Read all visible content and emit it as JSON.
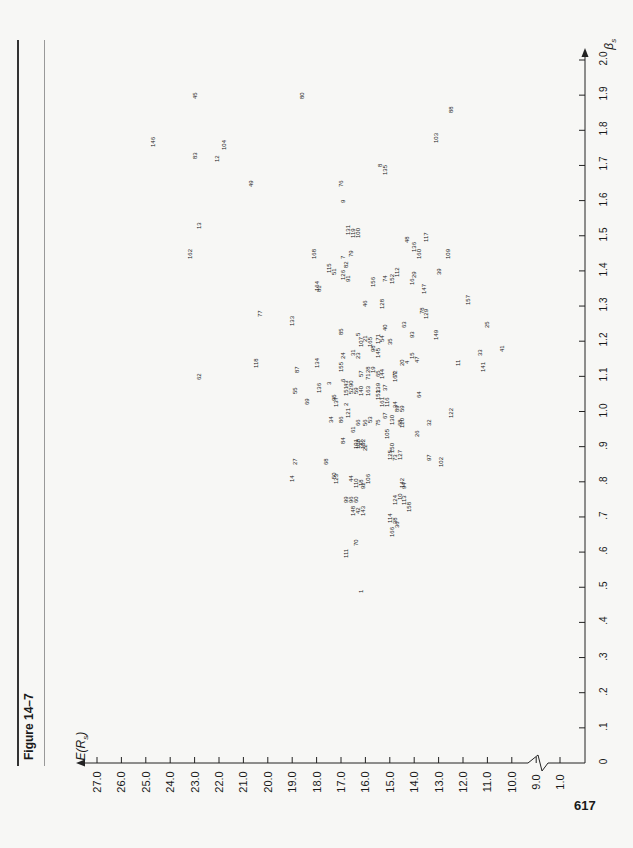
{
  "figure_label": "Figure 14–7",
  "page_number": "617",
  "chart_data": {
    "type": "scatter",
    "title": "Figure 14–7",
    "xlabel": "βs",
    "ylabel": "E(Rs)",
    "xlim": [
      0,
      2.0
    ],
    "ylim": [
      1.0,
      27.0
    ],
    "y_axis_break": "between 1.0 and 9.0",
    "x_ticks": [
      "0",
      ".1",
      ".2",
      ".3",
      ".4",
      ".5",
      ".6",
      ".7",
      ".8",
      ".9",
      "1.0",
      "1.1",
      "1.2",
      "1.3",
      "1.4",
      "1.5",
      "1.6",
      "1.7",
      "1.8",
      "1.9",
      "2.0"
    ],
    "y_ticks": [
      "27.0",
      "26.0",
      "25.0",
      "24.0",
      "23.0",
      "22.0",
      "21.0",
      "20.0",
      "19.0",
      "18.0",
      "17.0",
      "16.0",
      "15.0",
      "14.0",
      "13.0",
      "12.0",
      "11.0",
      "10.0",
      "9.0",
      "1.0"
    ],
    "grid": false,
    "orientation": "rotated 90° counter-clockwise on page",
    "points": [
      {
        "label": "146",
        "beta": 1.77,
        "er": 24.7
      },
      {
        "label": "45",
        "beta": 1.9,
        "er": 23.0
      },
      {
        "label": "83",
        "beta": 1.73,
        "er": 23.0
      },
      {
        "label": "104",
        "beta": 1.76,
        "er": 21.8
      },
      {
        "label": "12",
        "beta": 1.72,
        "er": 22.1
      },
      {
        "label": "80",
        "beta": 1.9,
        "er": 18.6
      },
      {
        "label": "49",
        "beta": 1.65,
        "er": 20.7
      },
      {
        "label": "13",
        "beta": 1.53,
        "er": 22.8
      },
      {
        "label": "162",
        "beta": 1.45,
        "er": 23.2
      },
      {
        "label": "168",
        "beta": 1.45,
        "er": 18.1
      },
      {
        "label": "76",
        "beta": 1.65,
        "er": 17.0
      },
      {
        "label": "9",
        "beta": 1.6,
        "er": 16.9
      },
      {
        "label": "8",
        "beta": 1.7,
        "er": 15.4
      },
      {
        "label": "135",
        "beta": 1.69,
        "er": 15.2
      },
      {
        "label": "88",
        "beta": 1.86,
        "er": 12.5
      },
      {
        "label": "103",
        "beta": 1.78,
        "er": 13.1
      },
      {
        "label": "131",
        "beta": 1.52,
        "er": 16.7
      },
      {
        "label": "119",
        "beta": 1.51,
        "er": 16.5
      },
      {
        "label": "100",
        "beta": 1.51,
        "er": 16.3
      },
      {
        "label": "48",
        "beta": 1.49,
        "er": 14.3
      },
      {
        "label": "136",
        "beta": 1.47,
        "er": 14.0
      },
      {
        "label": "160",
        "beta": 1.45,
        "er": 13.8
      },
      {
        "label": "117",
        "beta": 1.5,
        "er": 13.5
      },
      {
        "label": "109",
        "beta": 1.45,
        "er": 12.6
      },
      {
        "label": "7",
        "beta": 1.44,
        "er": 16.9
      },
      {
        "label": "79",
        "beta": 1.45,
        "er": 16.6
      },
      {
        "label": "115",
        "beta": 1.41,
        "er": 17.5
      },
      {
        "label": "51",
        "beta": 1.4,
        "er": 17.3
      },
      {
        "label": "82",
        "beta": 1.42,
        "er": 16.8
      },
      {
        "label": "126",
        "beta": 1.39,
        "er": 16.9
      },
      {
        "label": "91",
        "beta": 1.38,
        "er": 16.7
      },
      {
        "label": "112",
        "beta": 1.4,
        "er": 14.7
      },
      {
        "label": "164",
        "beta": 1.36,
        "er": 18.0
      },
      {
        "label": "81",
        "beta": 1.35,
        "er": 17.9
      },
      {
        "label": "156",
        "beta": 1.37,
        "er": 15.7
      },
      {
        "label": "74",
        "beta": 1.38,
        "er": 15.2
      },
      {
        "label": "152",
        "beta": 1.38,
        "er": 14.9
      },
      {
        "label": "16",
        "beta": 1.37,
        "er": 14.1
      },
      {
        "label": "29",
        "beta": 1.39,
        "er": 14.0
      },
      {
        "label": "39",
        "beta": 1.4,
        "er": 13.0
      },
      {
        "label": "147",
        "beta": 1.35,
        "er": 13.6
      },
      {
        "label": "157",
        "beta": 1.32,
        "er": 11.8
      },
      {
        "label": "46",
        "beta": 1.31,
        "er": 16.0
      },
      {
        "label": "128",
        "beta": 1.31,
        "er": 15.3
      },
      {
        "label": "78",
        "beta": 1.29,
        "er": 13.7
      },
      {
        "label": "129",
        "beta": 1.28,
        "er": 13.5
      },
      {
        "label": "77",
        "beta": 1.28,
        "er": 20.3
      },
      {
        "label": "133",
        "beta": 1.26,
        "er": 19.0
      },
      {
        "label": "85",
        "beta": 1.23,
        "er": 17.0
      },
      {
        "label": "40",
        "beta": 1.24,
        "er": 15.2
      },
      {
        "label": "63",
        "beta": 1.25,
        "er": 14.4
      },
      {
        "label": "5",
        "beta": 1.22,
        "er": 16.3
      },
      {
        "label": "171",
        "beta": 1.21,
        "er": 15.5
      },
      {
        "label": "54",
        "beta": 1.21,
        "er": 15.3
      },
      {
        "label": "35",
        "beta": 1.2,
        "er": 15.0
      },
      {
        "label": "93",
        "beta": 1.22,
        "er": 14.1
      },
      {
        "label": "149",
        "beta": 1.22,
        "er": 13.1
      },
      {
        "label": "33",
        "beta": 1.17,
        "er": 11.3
      },
      {
        "label": "25",
        "beta": 1.25,
        "er": 11.0
      },
      {
        "label": "41",
        "beta": 1.18,
        "er": 10.4
      },
      {
        "label": "141",
        "beta": 1.13,
        "er": 11.2
      },
      {
        "label": "11",
        "beta": 1.14,
        "er": 12.2
      },
      {
        "label": "107",
        "beta": 1.2,
        "er": 16.2
      },
      {
        "label": "21",
        "beta": 1.21,
        "er": 16.0
      },
      {
        "label": "165",
        "beta": 1.2,
        "er": 15.8
      },
      {
        "label": "98",
        "beta": 1.18,
        "er": 15.7
      },
      {
        "label": "145",
        "beta": 1.17,
        "er": 15.5
      },
      {
        "label": "15",
        "beta": 1.16,
        "er": 14.1
      },
      {
        "label": "47",
        "beta": 1.15,
        "er": 13.9
      },
      {
        "label": "62",
        "beta": 1.1,
        "er": 22.8
      },
      {
        "label": "118",
        "beta": 1.14,
        "er": 20.5
      },
      {
        "label": "134",
        "beta": 1.14,
        "er": 18.0
      },
      {
        "label": "87",
        "beta": 1.12,
        "er": 18.8
      },
      {
        "label": "24",
        "beta": 1.16,
        "er": 16.9
      },
      {
        "label": "31",
        "beta": 1.17,
        "er": 16.5
      },
      {
        "label": "23",
        "beta": 1.16,
        "er": 16.3
      },
      {
        "label": "155",
        "beta": 1.13,
        "er": 17.0
      },
      {
        "label": "136b",
        "beta": 1.07,
        "er": 17.9
      },
      {
        "label": "3",
        "beta": 1.08,
        "er": 17.5
      },
      {
        "label": "57",
        "beta": 1.11,
        "er": 16.2
      },
      {
        "label": "28",
        "beta": 1.12,
        "er": 15.9
      },
      {
        "label": "71",
        "beta": 1.1,
        "er": 15.9
      },
      {
        "label": "19",
        "beta": 1.12,
        "er": 15.7
      },
      {
        "label": "65",
        "beta": 1.11,
        "er": 15.5
      },
      {
        "label": "144",
        "beta": 1.11,
        "er": 15.3
      },
      {
        "label": "72",
        "beta": 1.11,
        "er": 14.8
      },
      {
        "label": "20",
        "beta": 1.14,
        "er": 14.5
      },
      {
        "label": "4",
        "beta": 1.14,
        "er": 14.3
      },
      {
        "label": "167",
        "beta": 1.1,
        "er": 14.8
      },
      {
        "label": "64",
        "beta": 1.05,
        "er": 13.8
      },
      {
        "label": "55",
        "beta": 1.06,
        "er": 18.9
      },
      {
        "label": "69",
        "beta": 1.03,
        "er": 18.4
      },
      {
        "label": "6",
        "beta": 1.09,
        "er": 16.9
      },
      {
        "label": "43",
        "beta": 1.08,
        "er": 16.8
      },
      {
        "label": "90",
        "beta": 1.08,
        "er": 16.6
      },
      {
        "label": "151",
        "beta": 1.06,
        "er": 16.8
      },
      {
        "label": "52",
        "beta": 1.06,
        "er": 16.6
      },
      {
        "label": "59",
        "beta": 1.06,
        "er": 16.4
      },
      {
        "label": "140",
        "beta": 1.06,
        "er": 16.2
      },
      {
        "label": "163",
        "beta": 1.06,
        "er": 15.9
      },
      {
        "label": "139",
        "beta": 1.07,
        "er": 15.5
      },
      {
        "label": "37",
        "beta": 1.07,
        "er": 15.2
      },
      {
        "label": "153",
        "beta": 1.05,
        "er": 15.5
      },
      {
        "label": "161",
        "beta": 1.03,
        "er": 15.3
      },
      {
        "label": "116",
        "beta": 1.03,
        "er": 15.1
      },
      {
        "label": "34",
        "beta": 1.02,
        "er": 14.8
      },
      {
        "label": "89",
        "beta": 1.01,
        "er": 14.7
      },
      {
        "label": "59b",
        "beta": 1.01,
        "er": 14.5
      },
      {
        "label": "122",
        "beta": 1.0,
        "er": 12.5
      },
      {
        "label": "32",
        "beta": 0.97,
        "er": 13.4
      },
      {
        "label": "2",
        "beta": 1.02,
        "er": 16.8
      },
      {
        "label": "121",
        "beta": 1.0,
        "er": 16.7
      },
      {
        "label": "95",
        "beta": 1.04,
        "er": 17.3
      },
      {
        "label": "137",
        "beta": 1.03,
        "er": 17.2
      },
      {
        "label": "34b",
        "beta": 0.98,
        "er": 17.4
      },
      {
        "label": "86",
        "beta": 0.98,
        "er": 17.0
      },
      {
        "label": "66",
        "beta": 0.97,
        "er": 16.3
      },
      {
        "label": "61",
        "beta": 0.95,
        "er": 16.5
      },
      {
        "label": "56",
        "beta": 0.97,
        "er": 16.0
      },
      {
        "label": "53",
        "beta": 0.98,
        "er": 15.8
      },
      {
        "label": "75",
        "beta": 0.97,
        "er": 15.5
      },
      {
        "label": "67",
        "beta": 0.99,
        "er": 15.2
      },
      {
        "label": "130",
        "beta": 0.98,
        "er": 14.9
      },
      {
        "label": "68b",
        "beta": 0.97,
        "er": 14.6
      },
      {
        "label": "120",
        "beta": 0.97,
        "er": 14.5
      },
      {
        "label": "26",
        "beta": 0.94,
        "er": 13.9
      },
      {
        "label": "105",
        "beta": 0.94,
        "er": 15.1
      },
      {
        "label": "84",
        "beta": 0.92,
        "er": 16.9
      },
      {
        "label": "101",
        "beta": 0.91,
        "er": 16.4
      },
      {
        "label": "30",
        "beta": 0.91,
        "er": 16.2
      },
      {
        "label": "108",
        "beta": 0.91,
        "er": 16.3
      },
      {
        "label": "132",
        "beta": 0.91,
        "er": 16.1
      },
      {
        "label": "22",
        "beta": 0.9,
        "er": 16.0
      },
      {
        "label": "150",
        "beta": 0.9,
        "er": 14.9
      },
      {
        "label": "127",
        "beta": 0.88,
        "er": 14.6
      },
      {
        "label": "125",
        "beta": 0.88,
        "er": 15.0
      },
      {
        "label": "73",
        "beta": 0.87,
        "er": 14.8
      },
      {
        "label": "97",
        "beta": 0.87,
        "er": 13.4
      },
      {
        "label": "102",
        "beta": 0.86,
        "er": 12.9
      },
      {
        "label": "68",
        "beta": 0.86,
        "er": 17.6
      },
      {
        "label": "27",
        "beta": 0.86,
        "er": 18.9
      },
      {
        "label": "14",
        "beta": 0.81,
        "er": 19.0
      },
      {
        "label": "50",
        "beta": 0.82,
        "er": 17.3
      },
      {
        "label": "123",
        "beta": 0.81,
        "er": 17.2
      },
      {
        "label": "44",
        "beta": 0.81,
        "er": 16.6
      },
      {
        "label": "110",
        "beta": 0.8,
        "er": 16.4
      },
      {
        "label": "18",
        "beta": 0.8,
        "er": 16.2
      },
      {
        "label": "92",
        "beta": 0.79,
        "er": 16.1
      },
      {
        "label": "106",
        "beta": 0.81,
        "er": 15.9
      },
      {
        "label": "142",
        "beta": 0.8,
        "er": 14.5
      },
      {
        "label": "94",
        "beta": 0.79,
        "er": 14.4
      },
      {
        "label": "124",
        "beta": 0.75,
        "er": 14.8
      },
      {
        "label": "10",
        "beta": 0.76,
        "er": 14.6
      },
      {
        "label": "113",
        "beta": 0.75,
        "er": 14.4
      },
      {
        "label": "158",
        "beta": 0.73,
        "er": 14.2
      },
      {
        "label": "99",
        "beta": 0.75,
        "er": 16.8
      },
      {
        "label": "96",
        "beta": 0.75,
        "er": 16.6
      },
      {
        "label": "60",
        "beta": 0.75,
        "er": 16.4
      },
      {
        "label": "148",
        "beta": 0.72,
        "er": 16.5
      },
      {
        "label": "42",
        "beta": 0.72,
        "er": 16.3
      },
      {
        "label": "143",
        "beta": 0.72,
        "er": 16.1
      },
      {
        "label": "114",
        "beta": 0.7,
        "er": 15.0
      },
      {
        "label": "38",
        "beta": 0.69,
        "er": 14.8
      },
      {
        "label": "36",
        "beta": 0.68,
        "er": 14.7
      },
      {
        "label": "166",
        "beta": 0.66,
        "er": 14.9
      },
      {
        "label": "70",
        "beta": 0.63,
        "er": 16.4
      },
      {
        "label": "111",
        "beta": 0.6,
        "er": 16.8
      },
      {
        "label": "1",
        "beta": 0.49,
        "er": 16.2
      }
    ]
  },
  "axes": {
    "y_title": "E(R",
    "y_title_sub": "s",
    "y_title_end": ")",
    "x_title": "β",
    "x_title_sub": "s",
    "origin_label": "0"
  }
}
